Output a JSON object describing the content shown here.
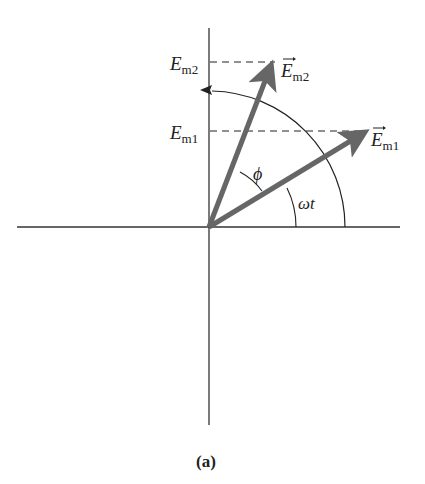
{
  "figure": {
    "type": "phasor diagram",
    "caption": "(a)",
    "colors": {
      "axis": "#333333",
      "phasor": "#666666",
      "dashed": "#222222",
      "text": "#222222"
    }
  },
  "axes": {
    "origin": [
      209,
      227
    ],
    "horizontal": {
      "x1": 17,
      "x2": 400
    },
    "vertical": {
      "y1": 28,
      "y2": 425
    }
  },
  "phasors": [
    {
      "name": "E_m1",
      "label_main": "E",
      "label_sub": "m1",
      "tip": [
        367,
        131
      ]
    },
    {
      "name": "E_m2",
      "label_main": "E",
      "label_sub": "m2",
      "tip": [
        273,
        62
      ]
    }
  ],
  "projections": [
    {
      "label_main": "E",
      "label_sub": "m1",
      "y": 131
    },
    {
      "label_main": "E",
      "label_sub": "m2",
      "y": 62
    }
  ],
  "angles": [
    {
      "symbol": "ωt",
      "description": "angle of E_m1 from horizontal"
    },
    {
      "symbol": "ϕ",
      "description": "phase difference between E_m1 and E_m2"
    }
  ],
  "rotation_arc": {
    "radius": 136,
    "direction": "counter-clockwise"
  }
}
